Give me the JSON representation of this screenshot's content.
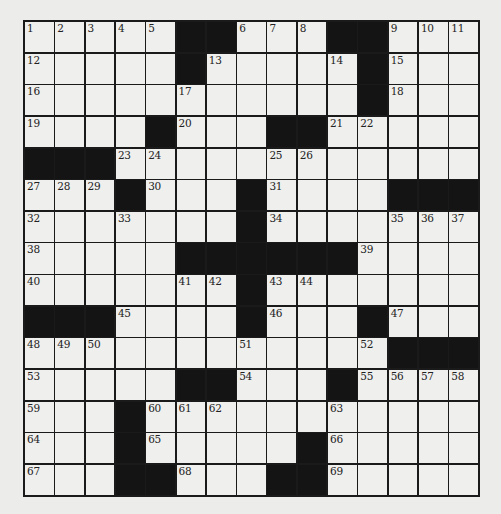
{
  "puzzle": {
    "size": {
      "rows": 15,
      "cols": 15
    },
    "colors": {
      "black_cell": "#141414",
      "white_cell": "#efefed",
      "grid_line": "#1a1a1a",
      "background": "#ececea"
    },
    "layout": [
      "OOOOO##OOO##OOO",
      "OOOOO#OOOOO#OOO",
      "OOOOOOOOOOO#OOO",
      "OOOO#OOO##OOOOO",
      "###OOOOOOOOOOOO",
      "OOO#OOO#OOOO###",
      "OOOOOOO#OOOOOOO",
      "OOOOO######OOOO",
      "OOOOOOO#OOOOOOO",
      "###OOOO#OOO#OOO",
      "OOOOOOOOOOOO###",
      "OOOOO##OOO#OOOO",
      "OOO#OOOOOOOOOOO",
      "OOO#OOOOO#OOOOO",
      "OOO##OOO##OOOOO"
    ],
    "numbers": [
      {
        "r": 0,
        "c": 0,
        "n": "1"
      },
      {
        "r": 0,
        "c": 1,
        "n": "2"
      },
      {
        "r": 0,
        "c": 2,
        "n": "3"
      },
      {
        "r": 0,
        "c": 3,
        "n": "4"
      },
      {
        "r": 0,
        "c": 4,
        "n": "5"
      },
      {
        "r": 0,
        "c": 7,
        "n": "6"
      },
      {
        "r": 0,
        "c": 8,
        "n": "7"
      },
      {
        "r": 0,
        "c": 9,
        "n": "8"
      },
      {
        "r": 0,
        "c": 12,
        "n": "9"
      },
      {
        "r": 0,
        "c": 13,
        "n": "10"
      },
      {
        "r": 0,
        "c": 14,
        "n": "11"
      },
      {
        "r": 1,
        "c": 0,
        "n": "12"
      },
      {
        "r": 1,
        "c": 6,
        "n": "13"
      },
      {
        "r": 1,
        "c": 10,
        "n": "14"
      },
      {
        "r": 1,
        "c": 12,
        "n": "15"
      },
      {
        "r": 2,
        "c": 0,
        "n": "16"
      },
      {
        "r": 2,
        "c": 5,
        "n": "17"
      },
      {
        "r": 2,
        "c": 12,
        "n": "18"
      },
      {
        "r": 3,
        "c": 0,
        "n": "19"
      },
      {
        "r": 3,
        "c": 5,
        "n": "20"
      },
      {
        "r": 3,
        "c": 10,
        "n": "21"
      },
      {
        "r": 3,
        "c": 11,
        "n": "22"
      },
      {
        "r": 4,
        "c": 3,
        "n": "23"
      },
      {
        "r": 4,
        "c": 4,
        "n": "24"
      },
      {
        "r": 4,
        "c": 8,
        "n": "25"
      },
      {
        "r": 4,
        "c": 9,
        "n": "26"
      },
      {
        "r": 5,
        "c": 0,
        "n": "27"
      },
      {
        "r": 5,
        "c": 1,
        "n": "28"
      },
      {
        "r": 5,
        "c": 2,
        "n": "29"
      },
      {
        "r": 5,
        "c": 4,
        "n": "30"
      },
      {
        "r": 5,
        "c": 8,
        "n": "31"
      },
      {
        "r": 6,
        "c": 0,
        "n": "32"
      },
      {
        "r": 6,
        "c": 3,
        "n": "33"
      },
      {
        "r": 6,
        "c": 8,
        "n": "34"
      },
      {
        "r": 6,
        "c": 12,
        "n": "35"
      },
      {
        "r": 6,
        "c": 13,
        "n": "36"
      },
      {
        "r": 6,
        "c": 14,
        "n": "37"
      },
      {
        "r": 7,
        "c": 0,
        "n": "38"
      },
      {
        "r": 7,
        "c": 11,
        "n": "39"
      },
      {
        "r": 8,
        "c": 0,
        "n": "40"
      },
      {
        "r": 8,
        "c": 5,
        "n": "41"
      },
      {
        "r": 8,
        "c": 6,
        "n": "42"
      },
      {
        "r": 8,
        "c": 8,
        "n": "43"
      },
      {
        "r": 8,
        "c": 9,
        "n": "44"
      },
      {
        "r": 9,
        "c": 3,
        "n": "45"
      },
      {
        "r": 9,
        "c": 8,
        "n": "46"
      },
      {
        "r": 9,
        "c": 12,
        "n": "47"
      },
      {
        "r": 10,
        "c": 0,
        "n": "48"
      },
      {
        "r": 10,
        "c": 1,
        "n": "49"
      },
      {
        "r": 10,
        "c": 2,
        "n": "50"
      },
      {
        "r": 10,
        "c": 7,
        "n": "51"
      },
      {
        "r": 10,
        "c": 11,
        "n": "52"
      },
      {
        "r": 11,
        "c": 0,
        "n": "53"
      },
      {
        "r": 11,
        "c": 7,
        "n": "54"
      },
      {
        "r": 11,
        "c": 11,
        "n": "55"
      },
      {
        "r": 11,
        "c": 12,
        "n": "56"
      },
      {
        "r": 11,
        "c": 13,
        "n": "57"
      },
      {
        "r": 11,
        "c": 14,
        "n": "58"
      },
      {
        "r": 12,
        "c": 0,
        "n": "59"
      },
      {
        "r": 12,
        "c": 4,
        "n": "60"
      },
      {
        "r": 12,
        "c": 5,
        "n": "61"
      },
      {
        "r": 12,
        "c": 6,
        "n": "62"
      },
      {
        "r": 12,
        "c": 10,
        "n": "63"
      },
      {
        "r": 13,
        "c": 0,
        "n": "64"
      },
      {
        "r": 13,
        "c": 4,
        "n": "65"
      },
      {
        "r": 13,
        "c": 10,
        "n": "66"
      },
      {
        "r": 14,
        "c": 0,
        "n": "67"
      },
      {
        "r": 14,
        "c": 5,
        "n": "68"
      },
      {
        "r": 14,
        "c": 10,
        "n": "69"
      }
    ]
  }
}
